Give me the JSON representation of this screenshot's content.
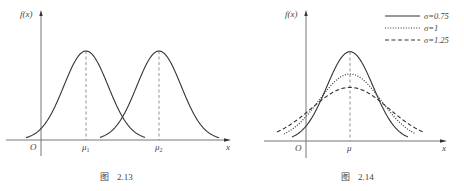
{
  "chart_data": [
    {
      "id": "fig-2-13",
      "type": "line",
      "title": "",
      "caption": {
        "prefix": "图",
        "number": "2.13"
      },
      "ylabel": "f(x)",
      "xlabel": "x",
      "origin_label": "O",
      "x_ticks": [
        "μ1",
        "μ2"
      ],
      "grid": false,
      "legend": null,
      "series": [
        {
          "name": "N(μ1, σ)",
          "mean_label": "μ1",
          "shape": "normal density",
          "style": "solid",
          "relative_peak": 1.0
        },
        {
          "name": "N(μ2, σ)",
          "mean_label": "μ2",
          "shape": "normal density",
          "style": "solid",
          "relative_peak": 1.0
        }
      ],
      "annotations": [
        "dashed vertical lines from peaks to μ1 and μ2",
        "curves have equal σ, different means (μ1 < μ2)"
      ],
      "render": {
        "origin": [
          41,
          140
        ],
        "x_end": 230,
        "y_top": 10,
        "means_px": [
          86,
          159
        ],
        "sigma_px": 22.2,
        "amp_px": 89,
        "ranges_px": [
          [
            26,
            145
          ],
          [
            100,
            219
          ]
        ]
      }
    },
    {
      "id": "fig-2-14",
      "type": "line",
      "title": "",
      "caption": {
        "prefix": "图",
        "number": "2.14"
      },
      "ylabel": "f(x)",
      "xlabel": "x",
      "origin_label": "O",
      "x_ticks": [
        "μ"
      ],
      "grid": false,
      "legend": {
        "position": "top-right",
        "entries": [
          "σ=0.75",
          "σ=1",
          "σ=1.25"
        ]
      },
      "series": [
        {
          "name": "σ=0.75",
          "sigma": 0.75,
          "style": "solid",
          "relative_peak": 1.333
        },
        {
          "name": "σ=1",
          "sigma": 1,
          "style": "dotted",
          "relative_peak": 1.0
        },
        {
          "name": "σ=1.25",
          "sigma": 1.25,
          "style": "dashed",
          "relative_peak": 0.8
        }
      ],
      "annotations": [
        "dashed vertical line at μ",
        "same mean μ, larger σ gives flatter, wider curve"
      ],
      "render": {
        "origin": [
          306,
          141
        ],
        "x_end": 446,
        "y_top": 10,
        "mean_px": 350,
        "unit_sigma_px": 31,
        "unit_amp_px": 67,
        "ranges_px": [
          [
            292,
            408
          ],
          [
            284,
            416
          ],
          [
            277,
            424
          ]
        ]
      }
    }
  ],
  "legend_labels": [
    "σ=0.75",
    "σ=1",
    "σ=1.25"
  ],
  "labels": {
    "fx": "f(x)",
    "x": "x",
    "origin": "O",
    "mu1_base": "μ",
    "mu1_sub": "1",
    "mu2_base": "μ",
    "mu2_sub": "2",
    "mu": "μ",
    "cap1_prefix": "图",
    "cap1_num": "2.13",
    "cap2_prefix": "图",
    "cap2_num": "2.14"
  },
  "colors": {
    "curve": "#333333",
    "axis": "#555555",
    "guide": "#777777"
  }
}
